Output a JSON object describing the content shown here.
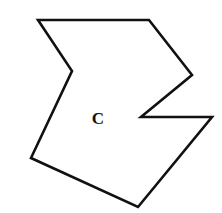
{
  "figure": {
    "width": 222,
    "height": 213,
    "background": "#ffffff",
    "stroke_color": "#111111",
    "stroke_width": 2.6,
    "polygon": {
      "name": "polygon-C",
      "points": [
        [
          38,
          20
        ],
        [
          149,
          20
        ],
        [
          192,
          75
        ],
        [
          141,
          117
        ],
        [
          212,
          117
        ],
        [
          138,
          207
        ],
        [
          31,
          158
        ],
        [
          72,
          71
        ]
      ]
    },
    "label": {
      "text": "C",
      "x": 98,
      "y": 124,
      "font_size": 17,
      "color": "#111111"
    }
  }
}
